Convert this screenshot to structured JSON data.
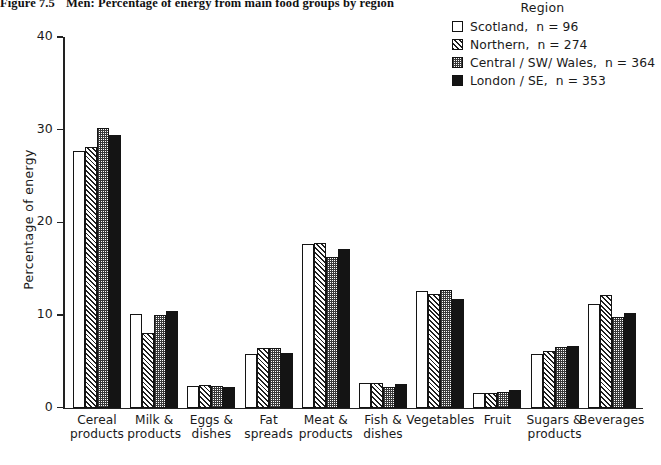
{
  "figure": {
    "number": "Figure 7.5",
    "title": "Men: Percentage of energy from main food groups by region"
  },
  "legend": {
    "title": "Region",
    "items": [
      {
        "label": "Scotland,",
        "n": "n = 96",
        "fill": "white"
      },
      {
        "label": "Northern,",
        "n": "n = 274",
        "fill": "hatch"
      },
      {
        "label": "Central / SW/ Wales,",
        "n": "n = 364",
        "fill": "dot"
      },
      {
        "label": "London / SE,",
        "n": "n = 353",
        "fill": "black"
      }
    ]
  },
  "axes": {
    "y_title": "Percentage of energy",
    "y_ticks": [
      "0",
      "10",
      "20",
      "30",
      "40"
    ]
  },
  "chart_data": {
    "type": "bar",
    "title": "Men: Percentage of energy from main food groups by region",
    "xlabel": "",
    "ylabel": "Percentage of energy",
    "ylim": [
      0,
      40
    ],
    "yticks": [
      0,
      10,
      20,
      30,
      40
    ],
    "grid": false,
    "legend_position": "top-right",
    "legend_title": "Region",
    "categories": [
      "Cereal products",
      "Milk & products",
      "Eggs & dishes",
      "Fat spreads",
      "Meat & products",
      "Fish & dishes",
      "Vegetables",
      "Fruit",
      "Sugars & products",
      "Beverages"
    ],
    "category_lines": [
      [
        "Cereal",
        "products"
      ],
      [
        "Milk &",
        "products"
      ],
      [
        "Eggs &",
        "dishes"
      ],
      [
        "Fat",
        "spreads"
      ],
      [
        "Meat &",
        "products"
      ],
      [
        "Fish &",
        "dishes"
      ],
      [
        "Vegetables",
        ""
      ],
      [
        "Fruit",
        ""
      ],
      [
        "Sugars &",
        "products"
      ],
      [
        "Beverages",
        ""
      ]
    ],
    "series": [
      {
        "name": "Scotland, n = 96",
        "fill": "white",
        "values": [
          27.7,
          10.1,
          2.3,
          5.8,
          17.7,
          2.7,
          12.6,
          1.6,
          5.8,
          11.2
        ]
      },
      {
        "name": "Northern, n = 274",
        "fill": "hatch",
        "values": [
          28.1,
          8.1,
          2.4,
          6.4,
          17.8,
          2.7,
          12.3,
          1.6,
          6.1,
          12.2
        ]
      },
      {
        "name": "Central / SW/ Wales, n = 364",
        "fill": "dot",
        "values": [
          30.2,
          10.0,
          2.3,
          6.4,
          16.3,
          2.2,
          12.7,
          1.7,
          6.5,
          9.8
        ]
      },
      {
        "name": "London / SE, n = 353",
        "fill": "black",
        "values": [
          29.4,
          10.4,
          2.2,
          5.9,
          17.1,
          2.5,
          11.7,
          1.9,
          6.6,
          10.2
        ]
      }
    ]
  }
}
